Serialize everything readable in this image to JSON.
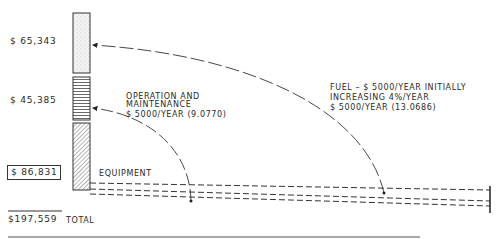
{
  "diagram": {
    "components": [
      {
        "id": "fuel",
        "amount": "$ 65,343",
        "pattern": "stipple",
        "description": [
          "FUEL – $ 5000/YEAR INITIALLY",
          "INCREASING 4%/YEAR",
          "$ 5000/YEAR (13.0686)"
        ]
      },
      {
        "id": "om",
        "amount": "$ 45,385",
        "pattern": "horizontal-lines",
        "description": [
          "OPERATION AND",
          "MAINTENANCE",
          "$ 5000/YEAR (9.0770)"
        ]
      },
      {
        "id": "equipment",
        "amount": "$ 86,831",
        "pattern": "diagonal-hatch",
        "description": [
          "EQUIPMENT"
        ]
      }
    ],
    "total": {
      "amount": "$197,559",
      "label": "TOTAL"
    }
  }
}
